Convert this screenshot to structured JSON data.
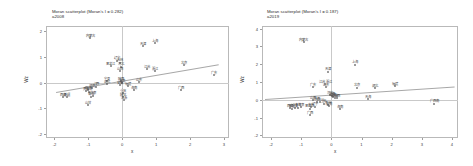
{
  "figure": {
    "panels": [
      {
        "id": "left",
        "title_line1": "Moran scatterplot (Moran's I = 0.282)",
        "title_line2": "a2008",
        "xlabel": "x",
        "ylabel": "Wz",
        "xticks": [
          "-2",
          "-1",
          "0",
          "1",
          "2",
          "3"
        ],
        "yticks": [
          "2",
          "1",
          "0",
          "-1",
          "-2"
        ],
        "chart_data": {
          "type": "scatter",
          "title": "Moran scatterplot (Moran's I = 0.282)",
          "subtitle": "a2008",
          "xlabel": "x",
          "ylabel": "Wz",
          "xlim": [
            -2.25,
            3.15
          ],
          "ylim": [
            -2.15,
            2.2
          ],
          "grid": false,
          "legend": "none",
          "morans_i": 0.282,
          "year": "a2008",
          "reference_lines": {
            "vertical_x": 0,
            "horizontal_y": 0
          },
          "fit_line": {
            "x1": -1.95,
            "y1": -0.36,
            "x2": 2.85,
            "y2": 0.72
          },
          "points": [
            {
              "label": "内蒙古",
              "x": -0.95,
              "y": 1.72
            },
            {
              "label": "天津",
              "x": 0.62,
              "y": 1.42
            },
            {
              "label": "上海",
              "x": 0.96,
              "y": 1.55
            },
            {
              "label": "辽宁",
              "x": -0.16,
              "y": 0.86
            },
            {
              "label": "吉林",
              "x": -0.07,
              "y": 0.78
            },
            {
              "label": "黑龙江",
              "x": -0.34,
              "y": 0.63
            },
            {
              "label": "河北",
              "x": -0.03,
              "y": 0.62
            },
            {
              "label": "山西",
              "x": -0.06,
              "y": 0.44
            },
            {
              "label": "江苏",
              "x": 0.74,
              "y": 0.52
            },
            {
              "label": "浙江",
              "x": 0.96,
              "y": 0.46
            },
            {
              "label": "北京",
              "x": 1.82,
              "y": 0.68
            },
            {
              "label": "广东",
              "x": 2.72,
              "y": 0.28
            },
            {
              "label": "宁夏",
              "x": -0.44,
              "y": 0.06
            },
            {
              "label": "陕西",
              "x": -0.05,
              "y": 0.05
            },
            {
              "label": "河南",
              "x": -0.02,
              "y": -0.02
            },
            {
              "label": "安徽",
              "x": -0.08,
              "y": -0.09
            },
            {
              "label": "山东",
              "x": 0.48,
              "y": 0.02
            },
            {
              "label": "湖北",
              "x": -0.46,
              "y": -0.06
            },
            {
              "label": "江西",
              "x": -0.76,
              "y": -0.15
            },
            {
              "label": "湖南",
              "x": -0.9,
              "y": -0.2
            },
            {
              "label": "四川",
              "x": -1.02,
              "y": -0.28
            },
            {
              "label": "贵州",
              "x": -1.06,
              "y": -0.32
            },
            {
              "label": "云南",
              "x": -0.99,
              "y": -0.35
            },
            {
              "label": "福建",
              "x": 0.16,
              "y": -0.14
            },
            {
              "label": "海南",
              "x": 0.36,
              "y": -0.3
            },
            {
              "label": "重庆",
              "x": 0.02,
              "y": -0.42
            },
            {
              "label": "广西",
              "x": 1.72,
              "y": -0.3
            },
            {
              "label": "青海",
              "x": -0.92,
              "y": -0.54
            },
            {
              "label": "甘肃",
              "x": -0.86,
              "y": -0.5
            },
            {
              "label": "西藏",
              "x": -1.76,
              "y": -0.55
            },
            {
              "label": "新疆",
              "x": -1.64,
              "y": -0.56
            },
            {
              "label": "陕甘",
              "x": 0.02,
              "y": -0.56
            },
            {
              "label": "江浙",
              "x": 0.06,
              "y": -0.68
            },
            {
              "label": "山甘",
              "x": -1.02,
              "y": -0.86
            }
          ]
        }
      },
      {
        "id": "right",
        "title_line1": "Moran scatterplot (Moran's I = 0.187)",
        "title_line2": "a2019",
        "xlabel": "x",
        "ylabel": "Wz",
        "xticks": [
          "-2",
          "-1",
          "0",
          "1",
          "2",
          "3",
          "4"
        ],
        "yticks": [
          "4",
          "3",
          "2",
          "1",
          "0",
          "-1",
          "-2"
        ],
        "chart_data": {
          "type": "scatter",
          "title": "Moran scatterplot (Moran's I = 0.187)",
          "subtitle": "a2019",
          "xlabel": "x",
          "ylabel": "Wz",
          "xlim": [
            -2.3,
            4.2
          ],
          "ylim": [
            -2.15,
            4.15
          ],
          "grid": false,
          "legend": "none",
          "morans_i": 0.187,
          "year": "a2019",
          "reference_lines": {
            "vertical_x": 0,
            "horizontal_y": 0
          },
          "fit_line": {
            "x1": -2.2,
            "y1": 0.02,
            "x2": 4.1,
            "y2": 0.72
          },
          "points": [
            {
              "label": "内蒙古",
              "x": -0.92,
              "y": 3.24
            },
            {
              "label": "上海",
              "x": 0.78,
              "y": 1.98
            },
            {
              "label": "天津",
              "x": -0.12,
              "y": 1.58
            },
            {
              "label": "江苏 浙江",
              "x": -0.2,
              "y": 0.86
            },
            {
              "label": "广东",
              "x": -0.62,
              "y": 0.72
            },
            {
              "label": "山东",
              "x": -0.18,
              "y": 0.72
            },
            {
              "label": "北京",
              "x": 0.86,
              "y": 0.68
            },
            {
              "label": "湖北",
              "x": 1.46,
              "y": 0.66
            },
            {
              "label": "福建",
              "x": 2.12,
              "y": 0.78
            },
            {
              "label": "河北",
              "x": -0.04,
              "y": 0.28
            },
            {
              "label": "河南",
              "x": 0.02,
              "y": 0.2
            },
            {
              "label": "湖南",
              "x": 0.06,
              "y": 0.14
            },
            {
              "label": "安徽",
              "x": 0.12,
              "y": 0.1
            },
            {
              "label": "江西",
              "x": 0.2,
              "y": 0.08
            },
            {
              "label": "山西",
              "x": -0.62,
              "y": -0.04
            },
            {
              "label": "陕西",
              "x": -0.48,
              "y": -0.1
            },
            {
              "label": "四川",
              "x": -0.38,
              "y": -0.14
            },
            {
              "label": "重庆",
              "x": -0.26,
              "y": -0.22
            },
            {
              "label": "贵州",
              "x": -0.12,
              "y": -0.3
            },
            {
              "label": "云南",
              "x": -0.08,
              "y": -0.34
            },
            {
              "label": "甘肃",
              "x": -1.0,
              "y": -0.4
            },
            {
              "label": "青海",
              "x": -1.12,
              "y": -0.44
            },
            {
              "label": "宁夏",
              "x": -1.22,
              "y": -0.48
            },
            {
              "label": "新疆",
              "x": -1.3,
              "y": -0.5
            },
            {
              "label": "西藏",
              "x": -1.36,
              "y": -0.46
            },
            {
              "label": "吉林",
              "x": -0.66,
              "y": -0.42
            },
            {
              "label": "辽宁",
              "x": -0.54,
              "y": -0.38
            },
            {
              "label": "黑龙江",
              "x": -0.72,
              "y": -0.5
            },
            {
              "label": "海南",
              "x": 0.28,
              "y": -0.52
            },
            {
              "label": "广西",
              "x": -0.72,
              "y": -0.88
            },
            {
              "label": "天海",
              "x": 1.22,
              "y": 0.04
            },
            {
              "label": "广西南",
              "x": 3.42,
              "y": -0.22
            }
          ]
        }
      }
    ]
  }
}
